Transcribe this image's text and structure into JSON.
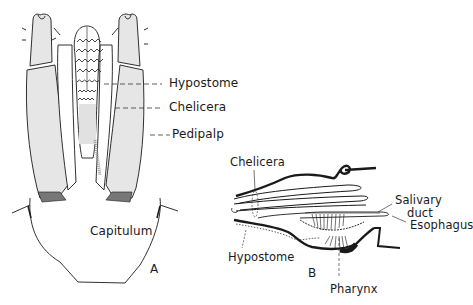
{
  "figure": {
    "panel_a": {
      "letter": "A",
      "labels": {
        "hypostome": "Hypostome",
        "chelicera": "Chelicera",
        "pedipalp": "Pedipalp",
        "capitulum": "Capitulum"
      }
    },
    "panel_b": {
      "letter": "B",
      "labels": {
        "chelicera": "Chelicera",
        "salivary_line1": "Salivary",
        "salivary_line2": "duct",
        "esophagus": "Esophagus",
        "hypostome": "Hypostome",
        "pharynx": "Pharynx"
      }
    },
    "colors": {
      "ink": "#1a1a1a",
      "background": "#ffffff",
      "shading": "#9a9a9a"
    }
  }
}
